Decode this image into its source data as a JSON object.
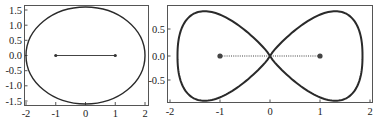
{
  "chart_data": [
    {
      "type": "line",
      "title": "",
      "description": "Ellipse with two foci joined by a solid segment",
      "xlabel": "",
      "ylabel": "",
      "xlim": [
        -2.1,
        2.1
      ],
      "ylim": [
        -1.65,
        1.65
      ],
      "x_ticks": [
        "-2",
        "-1",
        "0",
        "1",
        "2"
      ],
      "y_ticks": [
        "1.5",
        "1.0",
        "0.5",
        "0.0",
        "-0.5",
        "-1.0",
        "-1.5"
      ],
      "grid": false,
      "series": [
        {
          "name": "ellipse",
          "shape": "ellipse",
          "center": [
            0,
            0
          ],
          "semi_axis_x": 2.0,
          "semi_axis_y": 1.6,
          "style": "solid"
        },
        {
          "name": "foci-segment",
          "x": [
            -1,
            1
          ],
          "y": [
            0,
            0
          ],
          "style": "solid",
          "markers": true
        }
      ]
    },
    {
      "type": "line",
      "title": "",
      "description": "Figure-eight (lemniscate-like) curve with two foci joined by a dotted segment",
      "xlabel": "",
      "ylabel": "",
      "xlim": [
        -2.05,
        2.05
      ],
      "ylim": [
        -0.88,
        0.88
      ],
      "x_ticks": [
        "-2",
        "-1",
        "0",
        "1",
        "2"
      ],
      "y_ticks": [
        "0.5",
        "0.0",
        "-0.5"
      ],
      "grid": false,
      "series": [
        {
          "name": "figure-eight",
          "shape": "lemniscate",
          "x_extent": [
            -1.85,
            1.85
          ],
          "y_extent": [
            -0.83,
            0.83
          ],
          "crossing": [
            0,
            0
          ],
          "style": "solid"
        },
        {
          "name": "foci-segment",
          "x": [
            -1,
            1
          ],
          "y": [
            0,
            0
          ],
          "style": "dotted",
          "markers": true
        }
      ]
    }
  ],
  "left_plot": {
    "x_ticks": [
      "-2",
      "-1",
      "0",
      "1",
      "2"
    ],
    "y_ticks": [
      "1.5",
      "1.0",
      "0.5",
      "0.0",
      "-0.5",
      "-1.0",
      "-1.5"
    ]
  },
  "right_plot": {
    "x_ticks": [
      "-2",
      "-1",
      "0",
      "1",
      "2"
    ],
    "y_ticks": [
      "0.5",
      "0.0",
      "-0.5"
    ]
  }
}
